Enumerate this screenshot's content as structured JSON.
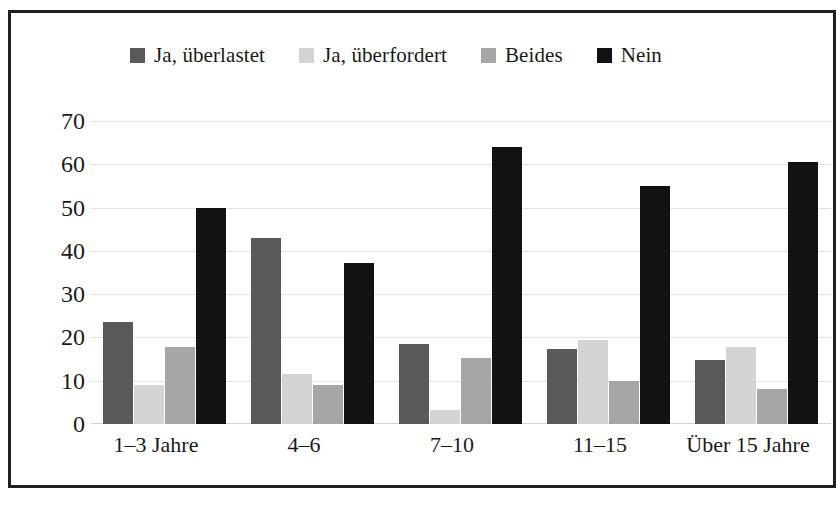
{
  "chart_data": {
    "type": "bar",
    "title": "",
    "xlabel": "",
    "ylabel": "",
    "ylim": [
      0,
      70
    ],
    "yticks": [
      70,
      60,
      50,
      40,
      30,
      20,
      10,
      0
    ],
    "grid": true,
    "legend_position": "top-center",
    "categories": [
      "1–3 Jahre",
      "4–6",
      "7–10",
      "11–15",
      "Über 15 Jahre"
    ],
    "series": [
      {
        "name": "Ja, überlastet",
        "color": "#595959",
        "values": [
          23.5,
          43.0,
          18.5,
          17.4,
          14.7
        ]
      },
      {
        "name": "Ja, überfordert",
        "color": "#d4d4d4",
        "values": [
          9.0,
          11.6,
          3.2,
          19.3,
          17.8
        ]
      },
      {
        "name": "Beides",
        "color": "#a6a6a6",
        "values": [
          17.8,
          9.0,
          15.3,
          10.0,
          8.0
        ]
      },
      {
        "name": "Nein",
        "color": "#121212",
        "values": [
          50.0,
          37.3,
          64.0,
          55.0,
          60.5
        ]
      }
    ]
  },
  "style": {
    "border_color": "#231f20",
    "gridline_color": "#e3e3e3",
    "text_color": "#1a1a1a",
    "background": "#ffffff"
  }
}
